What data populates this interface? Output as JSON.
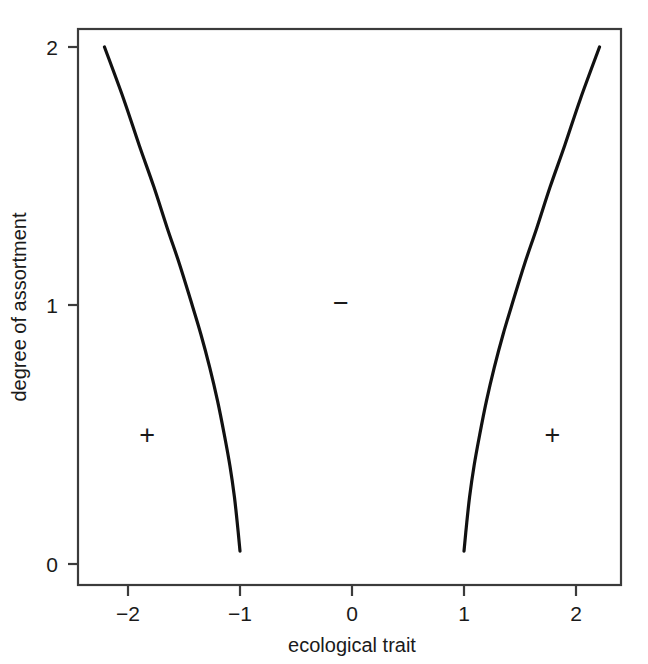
{
  "chart_data": {
    "type": "line",
    "title": "",
    "subtitle": "",
    "xlabel": "ecological trait",
    "ylabel": "degree of assortment",
    "xlim": [
      -2.45,
      2.4
    ],
    "ylim": [
      -0.09,
      2.08
    ],
    "xticks": [
      -2,
      -1,
      0,
      1,
      2
    ],
    "xticklabels": [
      "−2",
      "−1",
      "0",
      "1",
      "2"
    ],
    "yticks": [
      0,
      1,
      2
    ],
    "yticklabels": [
      "0",
      "1",
      "2"
    ],
    "grid": false,
    "legend": null,
    "frame": "box",
    "series": [
      {
        "name": "left branch",
        "comment": "trait = -sqrt(1 + y^2/4) style boundary, runs from (-1.00, 0.05) up to (-2.21, 2.00)",
        "x": [
          -1.0,
          -1.02,
          -1.05,
          -1.09,
          -1.14,
          -1.2,
          -1.27,
          -1.35,
          -1.44,
          -1.54,
          -1.65,
          -1.77,
          -1.9,
          -2.04,
          -2.21
        ],
        "y": [
          0.05,
          0.14,
          0.26,
          0.38,
          0.5,
          0.63,
          0.76,
          0.89,
          1.02,
          1.16,
          1.3,
          1.46,
          1.62,
          1.8,
          2.0
        ]
      },
      {
        "name": "right branch",
        "comment": "mirror image of the left branch, runs from (1.00, 0.05) up to (2.21, 2.00)",
        "x": [
          1.0,
          1.02,
          1.05,
          1.09,
          1.14,
          1.2,
          1.27,
          1.35,
          1.44,
          1.54,
          1.65,
          1.77,
          1.9,
          2.04,
          2.21
        ],
        "y": [
          0.05,
          0.14,
          0.26,
          0.38,
          0.5,
          0.63,
          0.76,
          0.89,
          1.02,
          1.16,
          1.3,
          1.46,
          1.62,
          1.8,
          2.0
        ]
      }
    ],
    "annotations": [
      {
        "text": "+",
        "x": -1.83,
        "y": 0.5,
        "name": "plus-sign-left"
      },
      {
        "text": "−",
        "x": -0.1,
        "y": 1.01,
        "name": "minus-sign-center"
      },
      {
        "text": "+",
        "x": 1.79,
        "y": 0.5,
        "name": "plus-sign-right"
      }
    ],
    "colors": {
      "curve": "#111111",
      "axis": "#3b3b3b",
      "text": "#1a1a1a",
      "background": "#ffffff"
    }
  }
}
